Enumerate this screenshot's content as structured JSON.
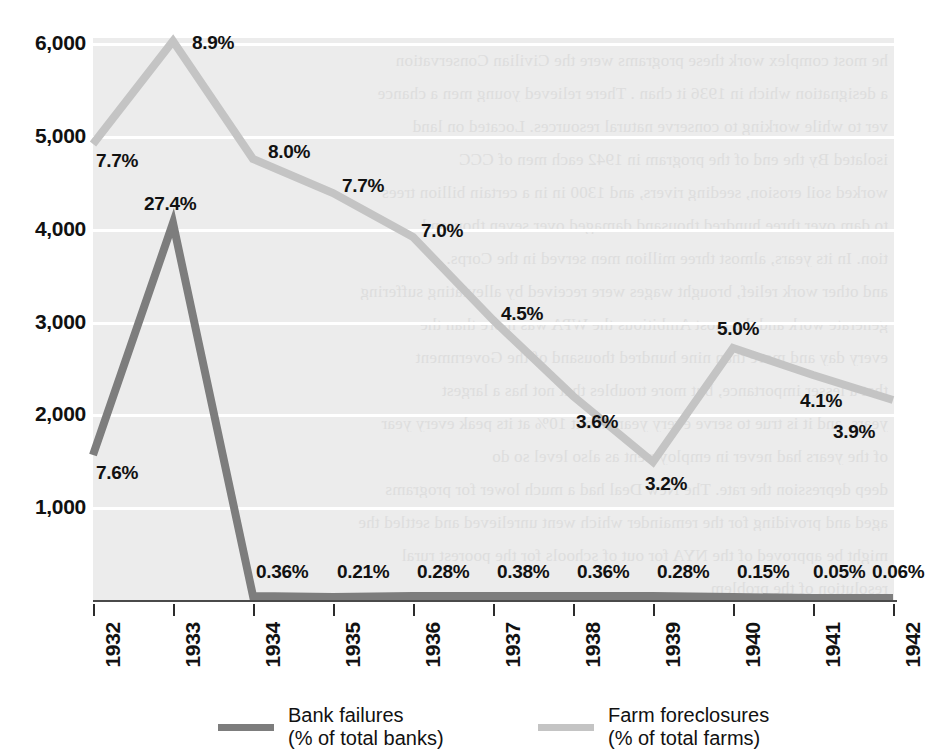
{
  "chart_data": {
    "type": "line",
    "title": "",
    "subtitle": "",
    "xlabel": "",
    "ylabel": "",
    "grid": true,
    "legend_position": "bottom",
    "x": [
      "1932",
      "1933",
      "1934",
      "1935",
      "1936",
      "1937",
      "1938",
      "1939",
      "1940",
      "1941",
      "1942"
    ],
    "categories": [
      "1932",
      "1933",
      "1934",
      "1935",
      "1936",
      "1937",
      "1938",
      "1939",
      "1940",
      "1941",
      "1942"
    ],
    "ylim": [
      0,
      6000
    ],
    "yticks": [
      1000,
      2000,
      3000,
      4000,
      5000,
      6000
    ],
    "ytick_labels": [
      "1,000",
      "2,000",
      "3,000",
      "4,000",
      "5,000",
      "6,000"
    ],
    "series": [
      {
        "name": "Bank failures",
        "legend_label_line1": "Bank failures",
        "legend_label_line2": "(% of total banks)",
        "color": "#7d7d7d",
        "values": [
          1560,
          4050,
          62,
          35,
          48,
          66,
          62,
          48,
          26,
          9,
          11
        ],
        "point_labels": [
          "7.6%",
          "27.4%",
          "0.36%",
          "0.21%",
          "0.28%",
          "0.38%",
          "0.36%",
          "0.28%",
          "0.15%",
          "0.05%",
          "0.06%"
        ]
      },
      {
        "name": "Farm foreclosures",
        "legend_label_line1": "Farm foreclosures",
        "legend_label_line2": "(% of total farms)",
        "color": "#c4c4c4",
        "values": [
          4900,
          5960,
          4720,
          4350,
          3880,
          3000,
          2200,
          1480,
          2720,
          2420,
          2150
        ],
        "point_labels": [
          "7.7%",
          "8.9%",
          "8.0%",
          "7.7%",
          "7.0%",
          "4.5%",
          "3.6%",
          "3.2%",
          "5.0%",
          "4.1%",
          "3.9%"
        ]
      }
    ]
  },
  "axes": {
    "y_labels": [
      "6,000",
      "5,000",
      "4,000",
      "3,000",
      "2,000",
      "1,000"
    ],
    "x_labels": [
      "1932",
      "1933",
      "1934",
      "1935",
      "1936",
      "1937",
      "1938",
      "1939",
      "1940",
      "1941",
      "1942"
    ]
  },
  "series_labels": {
    "bank": {
      "p1932": "7.6%",
      "p1933": "27.4%",
      "p1934": "0.36%",
      "p1935": "0.21%",
      "p1936": "0.28%",
      "p1937": "0.38%",
      "p1938": "0.36%",
      "p1939": "0.28%",
      "p1940": "0.15%",
      "p1941": "0.05%",
      "p1942": "0.06%"
    },
    "farm": {
      "p1932": "7.7%",
      "p1933": "8.9%",
      "p1934": "8.0%",
      "p1935": "7.7%",
      "p1936": "7.0%",
      "p1937": "4.5%",
      "p1938": "3.6%",
      "p1939": "3.2%",
      "p1940": "5.0%",
      "p1941": "4.1%",
      "p1942": "3.9%"
    }
  },
  "legend": {
    "bank_line1": "Bank failures",
    "bank_line2": "(% of total banks)",
    "farm_line1": "Farm foreclosures",
    "farm_line2": "(% of total farms)"
  },
  "colors": {
    "bank_series": "#7d7d7d",
    "farm_series": "#c4c4c4",
    "plot_background": "#ececec",
    "gridline": "#ffffff",
    "axis": "#4a4a4a",
    "text": "#111111"
  },
  "background_bleedthrough": {
    "note": "faint reverse-side print visible through the scanned page",
    "lines": [
      "he most complex work these programs were the Civilian Conservation",
      "a designation which in 1936 it chan  . There relieved young men a chance",
      "ver to while working to conserve natural resources. Located on land",
      "isolated By the end of the program in 1942 each men of CCC",
      "worked soil erosion, seeding rivers, and 1300 in in a certain billion trees",
      "to dam over three hundred thousand damaged over seven thousand",
      "tion. In its years, almost three million men served in the Corps.",
      "and other work relief, brought wages were received by alleviating suffering",
      "generate work and the most Ambitious the WPA was more than the",
      "every day and more than nine hundred thousand of the Government",
      "that a lesser importance, but more troubles that not has a largest",
      "years, and it is true to serve every year, about 10% at its peak every year",
      "of the years had never in employment as also level so do",
      "deep depression the rate. The New Deal had a much lower for programs",
      "aged and providing for the remainder which went unrelieved and settled the",
      "might be approved of the NYA for out of schools for the poorest rural",
      "resolution of the problem"
    ]
  }
}
